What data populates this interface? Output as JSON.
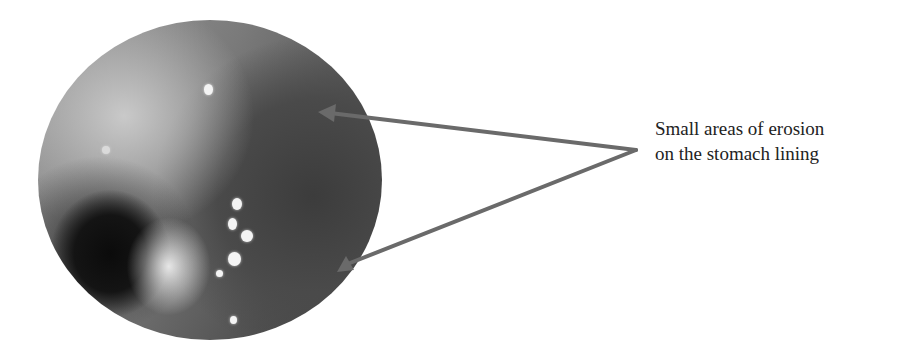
{
  "figure": {
    "image_description": "circular endoscopic view of stomach lining",
    "label_lines": [
      "Small areas of erosion",
      "on the stomach lining"
    ],
    "arrow_color": "#6a6a6a",
    "arrow_count": 2
  }
}
